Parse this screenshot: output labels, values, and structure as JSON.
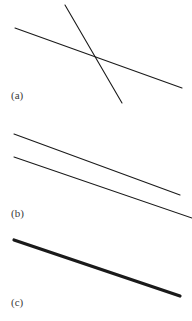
{
  "figure": {
    "background_color": "#ffffff",
    "width": 192,
    "height": 321,
    "line_color": "#1a1a1a",
    "label_color": "#3a3a3a"
  },
  "panels": [
    {
      "id": "a",
      "label": "(a)",
      "description": "two intersecting straight lines",
      "lines": [
        {
          "name": "shallow-descending-line",
          "x1": 15,
          "y1": 28,
          "x2": 182,
          "y2": 88,
          "stroke_width": 1.1
        },
        {
          "name": "steep-descending-line",
          "x1": 65,
          "y1": 5,
          "x2": 122,
          "y2": 103,
          "stroke_width": 1.1
        }
      ],
      "intersection": {
        "x": 95,
        "y": 60
      }
    },
    {
      "id": "b",
      "label": "(b)",
      "description": "two parallel straight lines",
      "lines": [
        {
          "name": "upper-parallel-line",
          "x1": 14,
          "y1": 19,
          "x2": 180,
          "y2": 80,
          "stroke_width": 1.1
        },
        {
          "name": "lower-parallel-line",
          "x1": 14,
          "y1": 42,
          "x2": 192,
          "y2": 103,
          "stroke_width": 1.1
        }
      ]
    },
    {
      "id": "c",
      "label": "(c)",
      "description": "single thick straight line",
      "lines": [
        {
          "name": "thick-descending-line",
          "x1": 14,
          "y1": 15,
          "x2": 180,
          "y2": 71,
          "stroke_width": 3.2
        }
      ]
    }
  ],
  "chart_data": {
    "type": "line",
    "title": "",
    "xlabel": "",
    "ylabel": "",
    "grid": false,
    "legend": "none",
    "panels": [
      {
        "panel": "(a)",
        "series": [
          {
            "name": "line-1",
            "x": [
              15,
              182
            ],
            "y": [
              28,
              88
            ]
          },
          {
            "name": "line-2",
            "x": [
              65,
              122
            ],
            "y": [
              5,
              103
            ]
          }
        ]
      },
      {
        "panel": "(b)",
        "series": [
          {
            "name": "line-1",
            "x": [
              14,
              180
            ],
            "y": [
              134,
              195
            ]
          },
          {
            "name": "line-2",
            "x": [
              14,
              192
            ],
            "y": [
              157,
              218
            ]
          }
        ]
      },
      {
        "panel": "(c)",
        "series": [
          {
            "name": "line-1",
            "x": [
              14,
              180
            ],
            "y": [
              240,
              296
            ]
          }
        ]
      }
    ]
  }
}
